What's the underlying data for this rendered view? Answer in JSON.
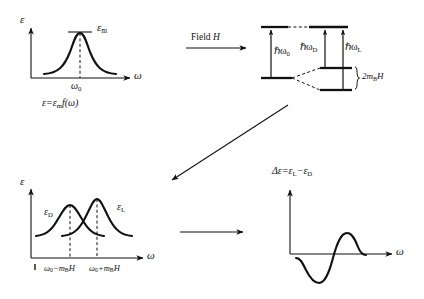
{
  "figure": {
    "background_color": "#ffffff",
    "ink_color": "#111111",
    "width": 424,
    "height": 299
  },
  "panels": {
    "top_left": {
      "name": "zero-field absorption curve",
      "y_axis_label": "ε",
      "x_axis_label": "ω",
      "peak_label": "ε",
      "peak_label_sub": "m",
      "center_tick_label": "ω",
      "center_tick_sub": "0",
      "caption_main": "ε=ε",
      "caption_sub": "m",
      "caption_tail": "f(ω)"
    },
    "top_right": {
      "name": "zeeman-energy-level-diagram",
      "transition_zero": "ℏω",
      "transition_zero_sub": "0",
      "transition_d": "ℏω",
      "transition_d_sub": "D",
      "transition_l": "ℏω",
      "transition_l_sub": "L",
      "splitting_label": "2m",
      "splitting_sub": "B",
      "splitting_tail": "H"
    },
    "bottom_left": {
      "name": "split-absorption-curves",
      "y_axis_label": "ε",
      "x_axis_label": "ω",
      "curve_d_label": "ε",
      "curve_d_sub": "D",
      "curve_l_label": "ε",
      "curve_l_sub": "L",
      "tick_left": "ω",
      "tick_left_sub": "0",
      "tick_left_tail": "−m",
      "tick_left_tail_sub": "B",
      "tick_left_tail2": "H",
      "tick_right": "ω",
      "tick_right_sub": "0",
      "tick_right_tail": "+m",
      "tick_right_tail_sub": "B",
      "tick_right_tail2": "H"
    },
    "bottom_right": {
      "name": "difference-dispersion-curve",
      "y_axis_label": "Δε=ε",
      "y_axis_sub1": "L",
      "y_axis_mid": "−ε",
      "y_axis_sub2": "D",
      "x_axis_label": "ω"
    }
  },
  "arrows": {
    "field_arrow": {
      "name": "field-h-arrow",
      "label_prefix": "Field ",
      "label_symbol": "H"
    },
    "diagonal_arrow": {
      "name": "diagonal-down-left-arrow",
      "label": ""
    },
    "bottom_arrow": {
      "name": "bottom-right-arrow",
      "label": ""
    }
  }
}
